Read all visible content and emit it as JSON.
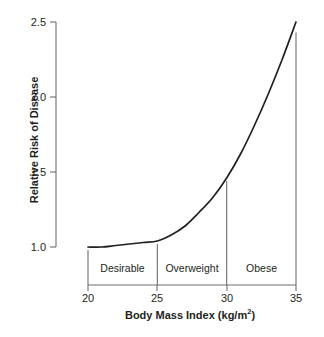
{
  "chart_data": {
    "type": "line",
    "title": "",
    "xlabel": "Body Mass Index (kg/m2)",
    "ylabel": "Relative Risk of Disease",
    "xlim": [
      20,
      35
    ],
    "ylim": [
      1.0,
      2.5
    ],
    "grid": false,
    "legend": "none",
    "xticks": [
      "20",
      "25",
      "30",
      "35"
    ],
    "xtick_values": [
      20,
      25,
      30,
      35
    ],
    "yticks": [
      "1.0",
      "1.5",
      "2.0",
      "2.5"
    ],
    "ytick_values": [
      1.0,
      1.5,
      2.0,
      2.5
    ],
    "line_color": "#231f20",
    "series": [
      {
        "name": "Relative Risk of Disease",
        "x": [
          20,
          21,
          22,
          23,
          24,
          25,
          26,
          27,
          28,
          29,
          30,
          31,
          32,
          33,
          34,
          35
        ],
        "values": [
          1.0,
          1.0,
          1.01,
          1.02,
          1.03,
          1.04,
          1.08,
          1.14,
          1.23,
          1.33,
          1.46,
          1.62,
          1.81,
          2.02,
          2.25,
          2.5
        ]
      }
    ],
    "annotations": [
      {
        "label": "Desirable",
        "x_start": 20,
        "x_end": 25
      },
      {
        "label": "Overweight",
        "x_start": 25,
        "x_end": 30
      },
      {
        "label": "Obese",
        "x_start": 30,
        "x_end": 35
      }
    ],
    "separator_lines": [
      {
        "x": 20,
        "y_top": 1.0
      },
      {
        "x": 25,
        "y_top": 1.04
      },
      {
        "x": 30,
        "y_top": 1.46
      },
      {
        "x": 35,
        "y_top": 2.45
      }
    ]
  },
  "axis_title_x_main": "Body Mass Index (kg/m",
  "axis_title_x_sup": "2",
  "axis_title_x_close": ")"
}
